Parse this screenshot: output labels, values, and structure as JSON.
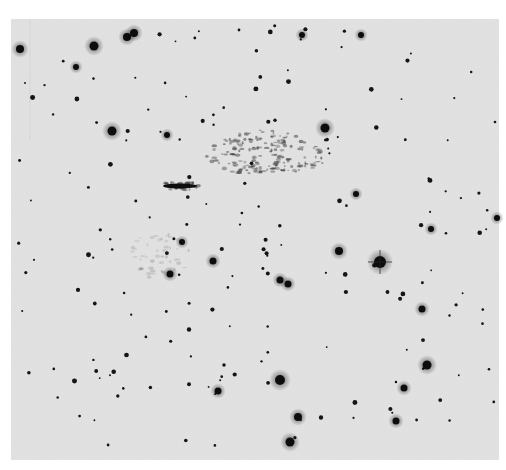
{
  "image": {
    "description": "Negative photographic plate of a star field with a faint filamentary nebula",
    "colors": {
      "page_background": "#ffffff",
      "plate_background": "#e2e2e2",
      "star": "#111111",
      "nebula": "#2a2a2a"
    },
    "plate": {
      "x": 11,
      "y": 19,
      "width": 488,
      "height": 441
    },
    "bright_stars": [
      {
        "x": 20,
        "y": 49,
        "r": 4
      },
      {
        "x": 94,
        "y": 46,
        "r": 4.5
      },
      {
        "x": 127,
        "y": 37,
        "r": 4
      },
      {
        "x": 134,
        "y": 33,
        "r": 4
      },
      {
        "x": 112,
        "y": 131,
        "r": 4.5
      },
      {
        "x": 167,
        "y": 135,
        "r": 3
      },
      {
        "x": 76,
        "y": 67,
        "r": 3
      },
      {
        "x": 325,
        "y": 128,
        "r": 4.5
      },
      {
        "x": 302,
        "y": 35,
        "r": 3
      },
      {
        "x": 361,
        "y": 35,
        "r": 3
      },
      {
        "x": 380,
        "y": 262,
        "r": 6
      },
      {
        "x": 339,
        "y": 251,
        "r": 4
      },
      {
        "x": 213,
        "y": 261,
        "r": 3.5
      },
      {
        "x": 182,
        "y": 242,
        "r": 3
      },
      {
        "x": 170,
        "y": 274,
        "r": 3.5
      },
      {
        "x": 280,
        "y": 280,
        "r": 3.5
      },
      {
        "x": 288,
        "y": 284,
        "r": 3.5
      },
      {
        "x": 356,
        "y": 194,
        "r": 3
      },
      {
        "x": 280,
        "y": 380,
        "r": 5
      },
      {
        "x": 298,
        "y": 417,
        "r": 4
      },
      {
        "x": 290,
        "y": 442,
        "r": 4.5
      },
      {
        "x": 427,
        "y": 365,
        "r": 4.5
      },
      {
        "x": 422,
        "y": 309,
        "r": 3.5
      },
      {
        "x": 218,
        "y": 391,
        "r": 3.5
      },
      {
        "x": 404,
        "y": 388,
        "r": 3.5
      },
      {
        "x": 396,
        "y": 421,
        "r": 3.5
      },
      {
        "x": 497,
        "y": 218,
        "r": 3
      },
      {
        "x": 431,
        "y": 229,
        "r": 3
      }
    ],
    "small_star_count": 180,
    "nebula_regions": [
      {
        "name": "main-arc",
        "cx": 265,
        "cy": 160,
        "rx": 60,
        "ry": 22
      },
      {
        "name": "streak",
        "cx": 180,
        "cy": 186,
        "rx": 22,
        "ry": 4
      },
      {
        "name": "faint-loop",
        "cx": 160,
        "cy": 255,
        "rx": 30,
        "ry": 25
      }
    ]
  }
}
